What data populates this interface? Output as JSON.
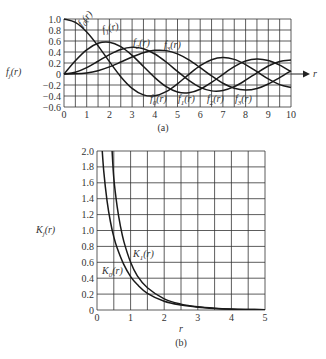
{
  "chart_data": [
    {
      "type": "line",
      "caption": "(a)",
      "title": "",
      "xlabel": "r",
      "ylabel": "f_j(r)",
      "xlim": [
        0,
        10
      ],
      "ylim": [
        -0.6,
        1.0
      ],
      "xticks": [
        "0",
        "1",
        "2",
        "3",
        "4",
        "5",
        "6",
        "7",
        "8",
        "9",
        "10"
      ],
      "yticks": [
        "1.0",
        "0.8",
        "0.6",
        "0.4",
        "0.2",
        "0",
        "-0.2",
        "-0.4",
        "-0.6"
      ],
      "grid": true,
      "x": [
        0,
        0.5,
        1,
        1.5,
        2,
        2.5,
        3,
        3.5,
        4,
        4.5,
        5,
        5.5,
        6,
        6.5,
        7,
        7.5,
        8,
        8.5,
        9,
        9.5,
        10
      ],
      "series": [
        {
          "name": "f0(r)",
          "values": [
            1.0,
            0.938,
            0.765,
            0.512,
            0.224,
            -0.048,
            -0.26,
            -0.38,
            -0.397,
            -0.321,
            -0.178,
            -0.007,
            0.151,
            0.26,
            0.3,
            0.266,
            0.172,
            0.042,
            -0.09,
            -0.194,
            -0.246
          ]
        },
        {
          "name": "f1(r)",
          "values": [
            0.0,
            0.242,
            0.44,
            0.558,
            0.577,
            0.497,
            0.339,
            0.137,
            -0.066,
            -0.231,
            -0.328,
            -0.341,
            -0.277,
            -0.154,
            -0.005,
            0.135,
            0.235,
            0.273,
            0.245,
            0.161,
            0.043
          ]
        },
        {
          "name": "f2(r)",
          "values": [
            0.0,
            0.031,
            0.115,
            0.232,
            0.353,
            0.446,
            0.486,
            0.459,
            0.364,
            0.218,
            0.047,
            -0.117,
            -0.243,
            -0.307,
            -0.301,
            -0.23,
            -0.113,
            0.022,
            0.145,
            0.228,
            0.255
          ]
        },
        {
          "name": "f3(r)",
          "values": [
            0.0,
            0.003,
            0.02,
            0.061,
            0.129,
            0.217,
            0.309,
            0.387,
            0.43,
            0.425,
            0.365,
            0.256,
            0.115,
            -0.035,
            -0.168,
            -0.258,
            -0.291,
            -0.263,
            -0.181,
            -0.065,
            0.058
          ]
        }
      ],
      "annotations": [
        "f0(r)",
        "f1(r)",
        "f2(r)",
        "f3(r)"
      ]
    },
    {
      "type": "line",
      "caption": "(b)",
      "title": "",
      "xlabel": "r",
      "ylabel": "K_j(r)",
      "xlim": [
        0,
        5
      ],
      "ylim": [
        0,
        2.0
      ],
      "xticks": [
        "0",
        "1",
        "2",
        "3",
        "4",
        "5"
      ],
      "yticks": [
        "2.0",
        "1.8",
        "1.6",
        "1.4",
        "1.2",
        "1.0",
        "0.8",
        "0.6",
        "0.4",
        "0.2",
        "0"
      ],
      "grid": true,
      "series": [
        {
          "name": "K0(r)",
          "x": [
            0.13,
            0.2,
            0.3,
            0.4,
            0.5,
            0.6,
            0.8,
            1.0,
            1.2,
            1.5,
            2.0,
            2.5,
            3.0,
            3.5,
            4.0,
            4.5,
            5.0
          ],
          "values": [
            2.17,
            1.75,
            1.37,
            1.11,
            0.92,
            0.78,
            0.57,
            0.42,
            0.32,
            0.21,
            0.11,
            0.062,
            0.035,
            0.02,
            0.011,
            0.0064,
            0.0037
          ]
        },
        {
          "name": "K1(r)",
          "x": [
            0.45,
            0.5,
            0.6,
            0.7,
            0.8,
            1.0,
            1.2,
            1.5,
            2.0,
            2.5,
            3.0,
            3.5,
            4.0,
            4.5,
            5.0
          ],
          "values": [
            2.0,
            1.66,
            1.3,
            1.05,
            0.86,
            0.6,
            0.43,
            0.28,
            0.14,
            0.074,
            0.04,
            0.022,
            0.012,
            0.0071,
            0.004
          ]
        }
      ],
      "annotations": [
        "K0(r)",
        "K1(r)"
      ]
    }
  ],
  "labels": {
    "top_ylabel": "f",
    "top_ylabel_sub": "j",
    "top_ylabel_tail": "(r)",
    "top_xlabel": "r",
    "top_caption": "(a)",
    "bot_ylabel": "K",
    "bot_ylabel_sub": "j",
    "bot_ylabel_tail": "(r)",
    "bot_xlabel": "r",
    "bot_caption": "(b)",
    "curve_labels_top": [
      {
        "name": "f",
        "sub": "0",
        "tail": "(r)"
      },
      {
        "name": "f",
        "sub": "1",
        "tail": "(r)"
      },
      {
        "name": "f",
        "sub": "2",
        "tail": "(r)"
      },
      {
        "name": "f",
        "sub": "3",
        "tail": "(r)"
      },
      {
        "name": "f",
        "sub": "0",
        "tail": "(r)"
      },
      {
        "name": "f",
        "sub": "1",
        "tail": "(r)"
      },
      {
        "name": "f",
        "sub": "2",
        "tail": "(r)"
      },
      {
        "name": "f",
        "sub": "3",
        "tail": "(r)"
      }
    ],
    "curve_labels_bottom": [
      {
        "name": "K",
        "sub": "1",
        "tail": "(r)"
      },
      {
        "name": "K",
        "sub": "0",
        "tail": "(r)"
      }
    ]
  }
}
